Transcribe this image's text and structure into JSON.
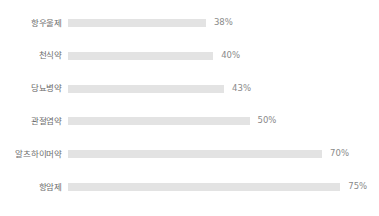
{
  "chart_data": {
    "type": "bar",
    "orientation": "horizontal",
    "title": "",
    "subtitle": "",
    "xlabel": "",
    "ylabel": "",
    "xlim": [
      0,
      100
    ],
    "grid": false,
    "legend": null,
    "value_suffix": "%",
    "bar_color": "#e3e3e3",
    "label_color": "#6d6d6d",
    "value_color": "#8a8a8a",
    "background": "#ffffff",
    "categories": [
      "항우울제",
      "천식약",
      "당뇨병약",
      "관절염약",
      "알츠하이머약",
      "항암제"
    ],
    "values": [
      38,
      40,
      43,
      50,
      70,
      75
    ],
    "value_labels": [
      "38%",
      "40%",
      "43%",
      "50%",
      "70%",
      "75%"
    ],
    "rows": [
      {
        "category": "항우울제",
        "value": 38,
        "value_label": "38%"
      },
      {
        "category": "천식약",
        "value": 40,
        "value_label": "40%"
      },
      {
        "category": "당뇨병약",
        "value": 43,
        "value_label": "43%"
      },
      {
        "category": "관절염약",
        "value": 50,
        "value_label": "50%"
      },
      {
        "category": "알츠하이머약",
        "value": 70,
        "value_label": "70%"
      },
      {
        "category": "항암제",
        "value": 75,
        "value_label": "75%"
      }
    ]
  }
}
